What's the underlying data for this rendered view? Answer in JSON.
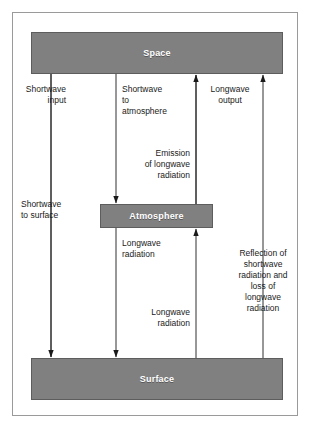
{
  "diagram": {
    "colors": {
      "box_fill": "#808080",
      "box_stroke": "#5d5d5d",
      "box_text": "#ffffff",
      "label_text": "#1a1a1a",
      "arrow": "#1a1a1a",
      "frame": "#9a9a9a",
      "background": "#ffffff"
    },
    "boxes": [
      {
        "id": "space",
        "label": "Space"
      },
      {
        "id": "atmosphere",
        "label": "Atmosphere"
      },
      {
        "id": "surface",
        "label": "Surface"
      }
    ],
    "flows": [
      {
        "id": "shortwave-input",
        "label": "Shortwave\ninput",
        "direction": "down",
        "from": "space",
        "to": "surface",
        "align": "right"
      },
      {
        "id": "shortwave-to-atmosphere",
        "label": "Shortwave\nto\natmosphere",
        "direction": "down",
        "from": "space",
        "to": "atmosphere",
        "align": "left"
      },
      {
        "id": "longwave-output",
        "label": "Longwave\noutput",
        "direction": "up",
        "from": "surface",
        "to": "space",
        "align": "center"
      },
      {
        "id": "emission-of-longwave-radiation",
        "label": "Emission\nof longwave\nradiation",
        "direction": "up",
        "from": "atmosphere",
        "to": "space",
        "align": "right"
      },
      {
        "id": "shortwave-to-surface",
        "label": "Shortwave\nto surface",
        "direction": "down",
        "from": "space",
        "to": "surface",
        "align": "left"
      },
      {
        "id": "longwave-radiation-atmosphere-to-surface",
        "label": "Longwave\nradiation",
        "direction": "down",
        "from": "atmosphere",
        "to": "surface",
        "align": "left"
      },
      {
        "id": "longwave-radiation-surface-to-atmosphere",
        "label": "Longwave\nradiation",
        "direction": "up",
        "from": "surface",
        "to": "atmosphere",
        "align": "right"
      },
      {
        "id": "reflection-and-loss",
        "label": "Reflection of\nshortwave\nradiation and\nloss of\nlongwave\nradiation",
        "direction": "up",
        "from": "surface",
        "to": "space",
        "align": "center"
      }
    ]
  }
}
